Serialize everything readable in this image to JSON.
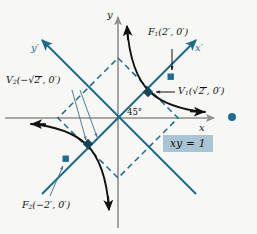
{
  "figure": {
    "type": "rotated-axes-hyperbola-diagram",
    "equation_box": "xy = 1",
    "rotation_angle": "45°",
    "origin_px": [
      118,
      118
    ],
    "axes": {
      "x_label": "x",
      "y_label": "y",
      "x_prime_label": "x",
      "x_prime_prime": "′",
      "y_prime_label": "y",
      "y_prime_prime": "′"
    },
    "points": [
      {
        "name": "focus-1",
        "label_prefix": "F",
        "label_sub": "1",
        "label_paren": "(2′, 0′)",
        "full": "F₁(2′, 0′)",
        "px": [
          157,
          72
        ]
      },
      {
        "name": "vertex-1",
        "label_prefix": "V",
        "label_sub": "1",
        "label_pre": "(",
        "label_radicand": "2",
        "label_post": "′, 0′)",
        "full": "V₁(√2′, 0′)",
        "px": [
          137,
          93
        ]
      },
      {
        "name": "vertex-2",
        "label_prefix": "V",
        "label_sub": "2",
        "label_pre": "(−",
        "label_radicand": "2",
        "label_post": "′, 0′)",
        "full": "V₂(−√2′, 0′)",
        "px": [
          98,
          142
        ]
      },
      {
        "name": "focus-2",
        "label_prefix": "F",
        "label_sub": "2",
        "label_paren": "(−2′, 0′)",
        "full": "F₂(−2′, 0′)",
        "px": [
          78,
          163
        ]
      },
      {
        "name": "stray-dot",
        "label_prefix": "",
        "label_sub": "",
        "full": "",
        "px": [
          232,
          117
        ]
      }
    ],
    "colors": {
      "teal": "#1c6b8c",
      "teal_dot": "#1d6d91",
      "axis_gray": "#8e8e8e",
      "curve_black": "#111111",
      "eqbox_bg": "#a9c4d2",
      "page_bg": "#f7f7f5"
    }
  }
}
